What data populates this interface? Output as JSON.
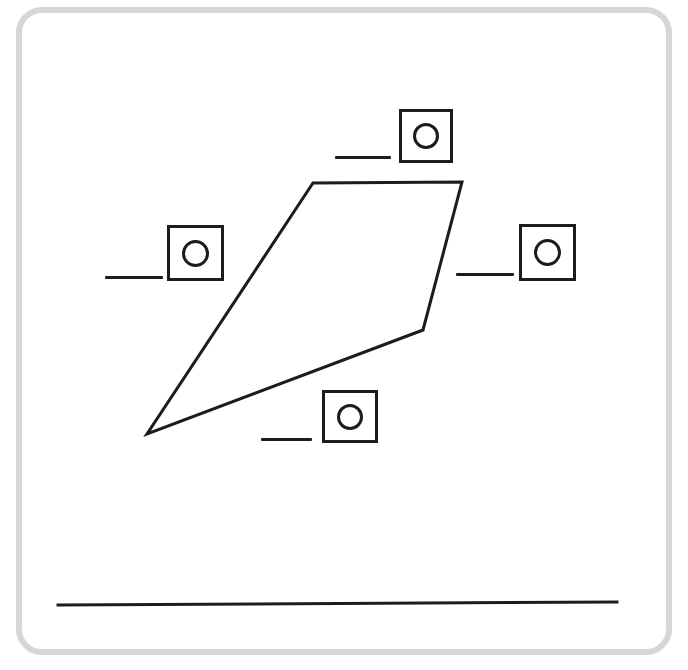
{
  "page": {
    "background_color": "#ffffff",
    "width": 688,
    "height": 670
  },
  "frame": {
    "name": "worksheet-frame",
    "border_color": "#d4d6d8",
    "corner_radius": 26
  },
  "figure": {
    "name": "quadrilateral",
    "stroke_color": "#1c1c1c",
    "stroke_width": 3,
    "fill": "none",
    "vertices": [
      {
        "label": "top-left",
        "x": 313,
        "y": 183
      },
      {
        "label": "top-right",
        "x": 462,
        "y": 182
      },
      {
        "label": "right",
        "x": 423,
        "y": 330
      },
      {
        "label": "bottom-left",
        "x": 147,
        "y": 434
      }
    ],
    "points_string": "313,183 462,182 423,330 147,434"
  },
  "baseline": {
    "name": "answer-baseline",
    "x1": 58,
    "y1": 605,
    "x2": 617,
    "y2": 602,
    "stroke_color": "#1c1c1c",
    "stroke_width": 3
  },
  "answer_slots": [
    {
      "id": "top",
      "name": "answer-slot-top",
      "side": "top-side",
      "box": {
        "x": 399,
        "y": 109,
        "width": 54,
        "height": 54
      },
      "circle": {
        "diameter": 26
      },
      "dash": {
        "x": 335,
        "y": 156,
        "width": 56
      },
      "value": "",
      "placeholder": ""
    },
    {
      "id": "left",
      "name": "answer-slot-left",
      "side": "left-side",
      "box": {
        "x": 167,
        "y": 225,
        "width": 57,
        "height": 56
      },
      "circle": {
        "diameter": 27
      },
      "dash": {
        "x": 105,
        "y": 276,
        "width": 58
      },
      "value": "",
      "placeholder": ""
    },
    {
      "id": "right",
      "name": "answer-slot-right",
      "side": "right-side",
      "box": {
        "x": 519,
        "y": 224,
        "width": 57,
        "height": 57
      },
      "circle": {
        "diameter": 27
      },
      "dash": {
        "x": 456,
        "y": 273,
        "width": 58
      },
      "value": "",
      "placeholder": ""
    },
    {
      "id": "bottom",
      "name": "answer-slot-bottom",
      "side": "bottom-side",
      "box": {
        "x": 322,
        "y": 390,
        "width": 56,
        "height": 53
      },
      "circle": {
        "diameter": 26
      },
      "dash": {
        "x": 261,
        "y": 438,
        "width": 51
      },
      "value": "",
      "placeholder": ""
    }
  ],
  "icons": {
    "circle_marker": "circle-marker-icon",
    "blank_dash": "blank-dash-icon"
  }
}
